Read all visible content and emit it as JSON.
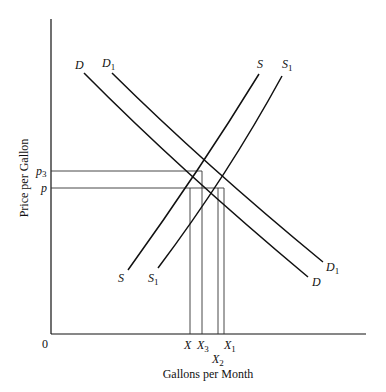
{
  "diagram": {
    "type": "supply-demand",
    "axes": {
      "x_title": "Gallons per Month",
      "y_title": "Price per Gallon",
      "origin_label": "0"
    },
    "curves": {
      "demand": {
        "label": "D",
        "sub": ""
      },
      "demand_shifted": {
        "label": "D",
        "sub": "1"
      },
      "supply": {
        "label": "S",
        "sub": ""
      },
      "supply_shifted": {
        "label": "S",
        "sub": "1"
      }
    },
    "price_ticks": [
      {
        "label": "p",
        "sub": "3"
      },
      {
        "label": "p",
        "sub": ""
      }
    ],
    "quantity_ticks": [
      {
        "label": "X",
        "sub": ""
      },
      {
        "label": "X",
        "sub": "3"
      },
      {
        "label": "X",
        "sub": "2"
      },
      {
        "label": "X",
        "sub": "1"
      }
    ],
    "colors": {
      "line": "#111111",
      "guide": "#333333",
      "background": "#ffffff"
    }
  }
}
